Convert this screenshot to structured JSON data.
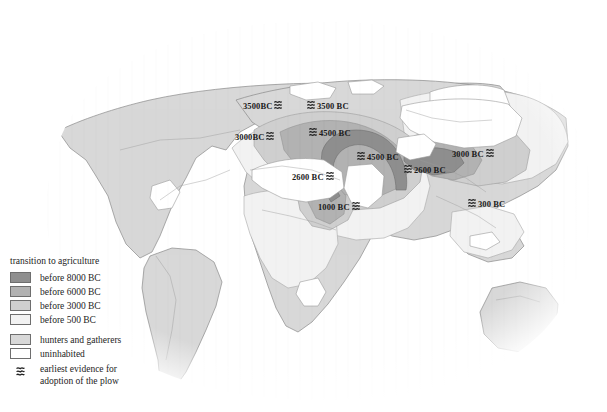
{
  "map": {
    "title": "World map of the transition to agriculture",
    "colors": {
      "before_8000bc": "#8f8f8f",
      "before_6000bc": "#b2b2b2",
      "before_3000bc": "#cfcfcf",
      "before_500bc": "#eeeeee",
      "hunters_gatherers": "#d8d8d8",
      "uninhabited": "#ffffff",
      "coastline": "#8a8a8a",
      "label_text": "#1b1b1b"
    },
    "labels": [
      {
        "id": "label-3500bc-britain",
        "text": "3500BC",
        "symbol": "plow-icon",
        "symbol_side": "after",
        "x": 243,
        "y": 100
      },
      {
        "id": "label-3500bc-northsea",
        "text": "3500 BC",
        "symbol": "plow-icon",
        "symbol_side": "before",
        "x": 307,
        "y": 100
      },
      {
        "id": "label-3000bc-iberia",
        "text": "3000BC",
        "symbol": "plow-icon",
        "symbol_side": "after",
        "x": 235,
        "y": 131
      },
      {
        "id": "label-4500bc-balkans",
        "text": "4500 BC",
        "symbol": "plow-icon",
        "symbol_side": "before",
        "x": 309,
        "y": 127
      },
      {
        "id": "label-4500bc-levant",
        "text": "4500 BC",
        "symbol": "plow-icon",
        "symbol_side": "before",
        "x": 357,
        "y": 151
      },
      {
        "id": "label-3000bc-china",
        "text": "3000 BC",
        "symbol": "plow-icon",
        "symbol_side": "after",
        "x": 452,
        "y": 148
      },
      {
        "id": "label-2600bc-egypt",
        "text": "2600 BC",
        "symbol": "plow-icon",
        "symbol_side": "after",
        "x": 292,
        "y": 171
      },
      {
        "id": "label-2600bc-indus",
        "text": "2600 BC",
        "symbol": "plow-icon",
        "symbol_side": "before",
        "x": 404,
        "y": 164
      },
      {
        "id": "label-300bc-seasia",
        "text": "300 BC",
        "symbol": "plow-icon",
        "symbol_side": "before",
        "x": 468,
        "y": 198
      },
      {
        "id": "label-1000bc-nubia",
        "text": "1000 BC",
        "symbol": "plow-icon",
        "symbol_side": "after",
        "x": 318,
        "y": 201
      }
    ]
  },
  "legend": {
    "title": "transition to agriculture",
    "classes": [
      {
        "label": "before 8000 BC",
        "color": "#8f8f8f"
      },
      {
        "label": "before 6000 BC",
        "color": "#b2b2b2"
      },
      {
        "label": "before 3000 BC",
        "color": "#cfcfcf"
      },
      {
        "label": "before 500 BC",
        "color": "#f2f2f2"
      }
    ],
    "other": [
      {
        "label": "hunters and gatherers",
        "color": "#d8d8d8"
      },
      {
        "label": "uninhabited",
        "color": "#ffffff"
      }
    ],
    "plow": {
      "symbol": "plow-icon",
      "line1": "earliest evidence for",
      "line2": "adoption of the plow",
      "label": "earliest evidence for adoption of the plow"
    }
  }
}
